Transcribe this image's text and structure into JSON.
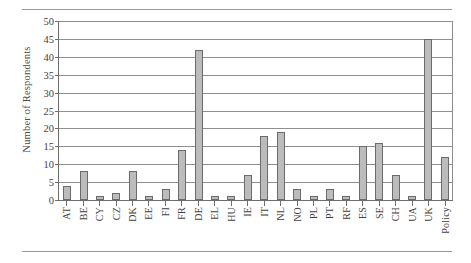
{
  "figure": {
    "rule_top": "horizontal-rule",
    "rule_bottom": "horizontal-rule"
  },
  "chart_data": {
    "type": "bar",
    "title": "",
    "xlabel": "",
    "ylabel": "Number of Respondents",
    "ylim": [
      0,
      50
    ],
    "ytick_step": 5,
    "yticks": [
      0,
      5,
      10,
      15,
      20,
      25,
      30,
      35,
      40,
      45,
      50
    ],
    "grid": true,
    "legend": null,
    "bar_color": "#bcbcbc",
    "bar_edge_color": "#6b6b6b",
    "categories": [
      "AT",
      "BE",
      "CY",
      "CZ",
      "DK",
      "EE",
      "FI",
      "FR",
      "DE",
      "EL",
      "HU",
      "IE",
      "IT",
      "NL",
      "NO",
      "PL",
      "PT",
      "RF",
      "ES",
      "SE",
      "CH",
      "UA",
      "UK",
      "Policy"
    ],
    "values": [
      4,
      8,
      1,
      2,
      8,
      1,
      3,
      14,
      42,
      1,
      1,
      7,
      18,
      19,
      3,
      1,
      3,
      1,
      15,
      16,
      7,
      1,
      45,
      12
    ]
  }
}
